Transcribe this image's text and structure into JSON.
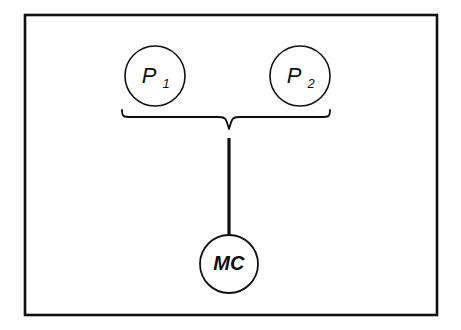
{
  "figure": {
    "type": "block-diagram",
    "background_color": "#ffffff",
    "stroke_color": "#101010",
    "border": {
      "name": "figure-frame",
      "x": 25,
      "y": 15,
      "width": 412,
      "height": 300,
      "stroke_width": 2.6
    },
    "nodes": [
      {
        "id": "p1",
        "name": "node-p1",
        "label_main": "P",
        "label_sub": "1",
        "cx": 155,
        "cy": 76,
        "r": 30,
        "stroke_width": 1.6
      },
      {
        "id": "p2",
        "name": "node-p2",
        "label_main": "P",
        "label_sub": "2",
        "cx": 300,
        "cy": 76,
        "r": 30,
        "stroke_width": 1.6
      },
      {
        "id": "mc",
        "name": "node-mc",
        "label_main": "MC",
        "label_sub": "",
        "cx": 229,
        "cy": 264,
        "r": 29,
        "stroke_width": 1.8
      }
    ],
    "brace": {
      "name": "underbrace-connector",
      "left_x": 122,
      "right_x": 330,
      "top_y": 110,
      "bar_y": 117,
      "tip_x": 229,
      "tip_y": 129,
      "stroke_width": 1.8
    },
    "connector": {
      "name": "brace-to-mc-line",
      "x": 229,
      "y_start": 138,
      "y_end": 236,
      "stroke_width": 3.2
    }
  }
}
